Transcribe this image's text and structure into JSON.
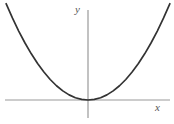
{
  "figure": {
    "name": "parabola-graph",
    "background_color": "#ffffff",
    "width": 174,
    "height": 124
  },
  "axes": {
    "x_axis": {
      "label": "x",
      "color": "#999999",
      "stroke_width": 1.2,
      "y_pixel": 100,
      "x_start_pixel": 5,
      "x_end_pixel": 170
    },
    "y_axis": {
      "label": "y",
      "color": "#999999",
      "stroke_width": 1.2,
      "x_pixel": 88,
      "y_start_pixel": 10,
      "y_end_pixel": 118
    },
    "origin": {
      "x": 88,
      "y": 100
    }
  },
  "curve": {
    "name": "parabola",
    "equation": "y = x^2",
    "color": "#333333",
    "stroke_width": 1.7,
    "vertex": {
      "x": 0,
      "y": 0
    },
    "opens": "upward"
  },
  "chart_data": {
    "type": "line",
    "title": "",
    "subtitle": "",
    "xlabel": "x",
    "ylabel": "y",
    "grid": false,
    "legend": "none",
    "xlim": [
      -1.35,
      1.35
    ],
    "ylim": [
      -0.22,
      1.55
    ],
    "annotations": [],
    "series": [
      {
        "name": "y = x^2",
        "color": "#333333",
        "x": [
          -1.3,
          -1.2,
          -1.1,
          -1.0,
          -0.9,
          -0.8,
          -0.7,
          -0.6,
          -0.5,
          -0.4,
          -0.3,
          -0.2,
          -0.1,
          0.0,
          0.1,
          0.2,
          0.3,
          0.4,
          0.5,
          0.6,
          0.7,
          0.8,
          0.9,
          1.0,
          1.1,
          1.2,
          1.3
        ],
        "y": [
          1.69,
          1.44,
          1.21,
          1.0,
          0.81,
          0.64,
          0.49,
          0.36,
          0.25,
          0.16,
          0.09,
          0.04,
          0.01,
          0.0,
          0.01,
          0.04,
          0.09,
          0.16,
          0.25,
          0.36,
          0.49,
          0.64,
          0.81,
          1.0,
          1.21,
          1.44,
          1.69
        ]
      }
    ],
    "xticks": [],
    "yticks": [],
    "xticklabels": [],
    "yticklabels": []
  }
}
